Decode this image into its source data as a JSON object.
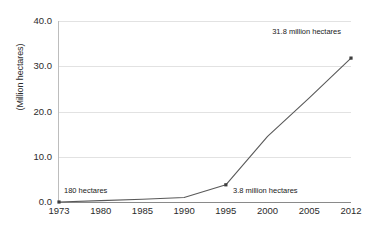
{
  "chart_data": {
    "type": "line",
    "title": "",
    "subtitle": "",
    "xlabel": "",
    "ylabel": "(Million hectares)",
    "categories": [
      "1973",
      "1980",
      "1985",
      "1990",
      "1995",
      "2000",
      "2005",
      "2012"
    ],
    "values": [
      0.0002,
      0.3,
      0.6,
      1.0,
      3.8,
      14.5,
      23.0,
      31.8
    ],
    "series": [
      {
        "name": "Area",
        "values": [
          0.0002,
          0.3,
          0.6,
          1.0,
          3.8,
          14.5,
          23.0,
          31.8
        ]
      }
    ],
    "ylim": [
      0,
      40
    ],
    "yticks": [
      "0.0",
      "10.0",
      "20.0",
      "30.0",
      "40.0"
    ],
    "ytick_values": [
      0,
      10,
      20,
      30,
      40
    ],
    "grid": true,
    "legend": "none",
    "markers": true,
    "line_color": "#595959",
    "grid_color": "#e2e2e2",
    "axis_color": "#8a8a8a",
    "text_color": "#2b2b2b",
    "annotations": [
      {
        "id": "annotation-1973",
        "text": "180 hectares",
        "category": "1973",
        "value": 0.0002
      },
      {
        "id": "annotation-1995",
        "text": "3.8 million hectares",
        "category": "1995",
        "value": 3.8
      },
      {
        "id": "annotation-2012",
        "text": "31.8 million hectares",
        "category": "2012",
        "value": 31.8
      }
    ]
  }
}
